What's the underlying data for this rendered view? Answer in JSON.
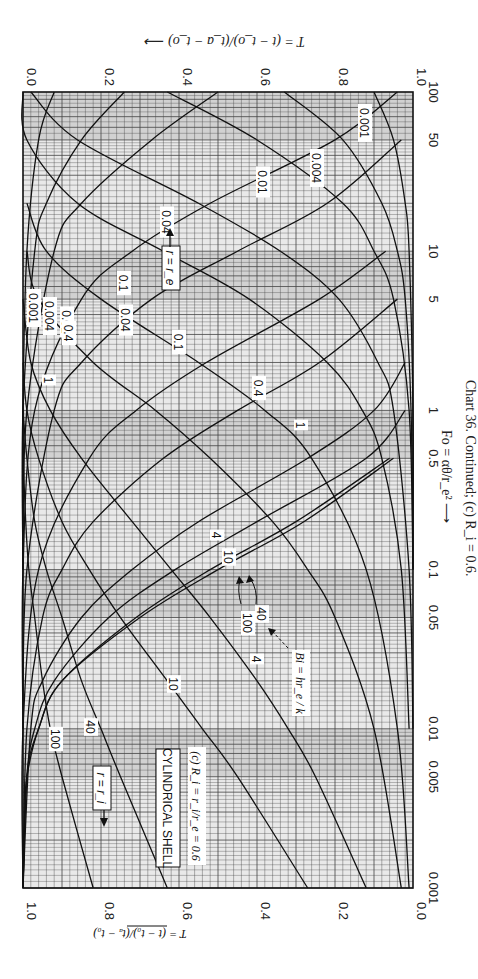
{
  "chart_data": {
    "type": "line",
    "title": "CYLINDRICAL SHELL",
    "subtitle": "(c) R_i = r_i/r_e = 0.6",
    "caption": "Chart 36. Continued; (c) R_i = 0.6.",
    "orientation": "rotated 90° clockwise (Fo axis vertical, T axis horizontal)",
    "xlabel": "Fo = αθ/r_e²",
    "xscale": "log",
    "xlim": [
      0.001,
      100
    ],
    "xticks": [
      0.001,
      0.005,
      0.01,
      0.05,
      0.1,
      0.5,
      1,
      5,
      10,
      50,
      100
    ],
    "xtick_labels": [
      "0.001",
      "0.005",
      "0.01",
      "0.05",
      "0.1",
      "0.5",
      "1",
      "5",
      "10",
      "50",
      "100"
    ],
    "ylabel": "T = (t − t_o)/(t_a − t_o)",
    "ylim": [
      0,
      1
    ],
    "yticks": [
      0.0,
      0.2,
      0.4,
      0.6,
      0.8,
      1.0
    ],
    "ytick_labels": [
      "0.0",
      "0.2",
      "0.4",
      "0.6",
      "0.8",
      "1.0"
    ],
    "grid": true,
    "parameter_label": "Bi = hr_e/k",
    "annotations": [
      "r = r_i",
      "r = r_e",
      "100",
      "40",
      "Bi = hr_e / k"
    ],
    "series_group_ri": {
      "name": "r = r_i",
      "axis": "left T-axis (1.0 at left, 0.0 at right)",
      "series": [
        {
          "name": "Bi=100",
          "x": [
            0.001,
            0.005,
            0.01,
            0.02,
            0.05,
            0.1,
            0.2,
            0.5,
            1
          ],
          "y": [
            0.82,
            0.9,
            0.93,
            0.95,
            0.97,
            0.985,
            0.993,
            0.999,
            1.0
          ]
        },
        {
          "name": "Bi=40",
          "x": [
            0.001,
            0.005,
            0.01,
            0.02,
            0.05,
            0.1,
            0.2,
            0.5,
            1
          ],
          "y": [
            0.63,
            0.75,
            0.8,
            0.85,
            0.9,
            0.94,
            0.97,
            0.99,
            1.0
          ]
        },
        {
          "name": "Bi=10",
          "x": [
            0.001,
            0.005,
            0.01,
            0.02,
            0.05,
            0.1,
            0.2,
            0.5,
            1,
            2
          ],
          "y": [
            0.27,
            0.45,
            0.54,
            0.63,
            0.75,
            0.83,
            0.9,
            0.96,
            0.99,
            1.0
          ]
        },
        {
          "name": "Bi=4",
          "x": [
            0.001,
            0.005,
            0.01,
            0.02,
            0.05,
            0.1,
            0.2,
            0.5,
            1,
            2,
            5
          ],
          "y": [
            0.12,
            0.25,
            0.32,
            0.4,
            0.52,
            0.62,
            0.72,
            0.85,
            0.93,
            0.98,
            1.0
          ]
        },
        {
          "name": "Bi=1",
          "x": [
            0.001,
            0.01,
            0.05,
            0.1,
            0.2,
            0.5,
            1,
            2,
            5,
            10
          ],
          "y": [
            0.03,
            0.1,
            0.2,
            0.27,
            0.36,
            0.52,
            0.66,
            0.82,
            0.96,
            0.99
          ]
        },
        {
          "name": "Bi=0.4",
          "x": [
            0.001,
            0.01,
            0.1,
            0.5,
            1,
            2,
            5,
            10,
            20
          ],
          "y": [
            0.01,
            0.04,
            0.12,
            0.26,
            0.38,
            0.55,
            0.8,
            0.94,
            0.99
          ]
        },
        {
          "name": "Bi=0.1",
          "x": [
            0.01,
            0.1,
            0.5,
            1,
            2,
            5,
            10,
            20,
            50,
            100
          ],
          "y": [
            0.01,
            0.03,
            0.08,
            0.13,
            0.22,
            0.42,
            0.64,
            0.86,
            0.99,
            1.0
          ]
        },
        {
          "name": "Bi=0.04",
          "x": [
            0.01,
            0.1,
            1,
            2,
            5,
            10,
            20,
            50,
            100
          ],
          "y": [
            0.0,
            0.01,
            0.05,
            0.09,
            0.19,
            0.34,
            0.55,
            0.86,
            0.98
          ]
        },
        {
          "name": "Bi=0.01",
          "x": [
            0.1,
            1,
            5,
            10,
            20,
            50,
            100
          ],
          "y": [
            0.0,
            0.01,
            0.05,
            0.1,
            0.18,
            0.4,
            0.63
          ]
        },
        {
          "name": "Bi=0.004",
          "x": [
            0.1,
            1,
            5,
            10,
            20,
            50,
            100
          ],
          "y": [
            0.0,
            0.005,
            0.02,
            0.04,
            0.08,
            0.18,
            0.33
          ]
        },
        {
          "name": "Bi=0.001",
          "x": [
            0.1,
            1,
            10,
            20,
            50,
            100
          ],
          "y": [
            0.0,
            0.0,
            0.01,
            0.02,
            0.05,
            0.1
          ]
        }
      ]
    },
    "series_group_re": {
      "name": "r = r_e",
      "axis": "right T-axis (0.0 at left, 1.0 at right)",
      "series": [
        {
          "name": "Bi=100",
          "x": [
            0.001,
            0.003,
            0.005,
            0.01,
            0.02,
            0.05,
            0.1,
            0.2,
            0.5
          ],
          "y": [
            0.0,
            0.005,
            0.01,
            0.04,
            0.1,
            0.3,
            0.5,
            0.72,
            0.95
          ]
        },
        {
          "name": "Bi=40",
          "x": [
            0.001,
            0.005,
            0.01,
            0.02,
            0.05,
            0.1,
            0.2,
            0.5
          ],
          "y": [
            0.0,
            0.01,
            0.04,
            0.1,
            0.29,
            0.48,
            0.7,
            0.94
          ]
        },
        {
          "name": "Bi=10",
          "x": [
            0.001,
            0.005,
            0.01,
            0.02,
            0.05,
            0.1,
            0.2,
            0.5,
            1
          ],
          "y": [
            0.0,
            0.01,
            0.03,
            0.08,
            0.22,
            0.39,
            0.6,
            0.88,
            0.98
          ]
        },
        {
          "name": "Bi=4",
          "x": [
            0.001,
            0.01,
            0.02,
            0.05,
            0.1,
            0.2,
            0.5,
            1,
            2
          ],
          "y": [
            0.0,
            0.02,
            0.05,
            0.15,
            0.28,
            0.45,
            0.73,
            0.9,
            0.98
          ]
        },
        {
          "name": "Bi=1",
          "x": [
            0.001,
            0.01,
            0.05,
            0.1,
            0.2,
            0.5,
            1,
            2,
            5
          ],
          "y": [
            0.0,
            0.01,
            0.05,
            0.1,
            0.18,
            0.36,
            0.55,
            0.76,
            0.96
          ]
        },
        {
          "name": "Bi=0.4",
          "x": [
            0.001,
            0.01,
            0.1,
            0.5,
            1,
            2,
            5,
            10
          ],
          "y": [
            0.0,
            0.0,
            0.04,
            0.17,
            0.29,
            0.47,
            0.76,
            0.93
          ]
        },
        {
          "name": "Bi=0.1",
          "x": [
            0.01,
            0.1,
            1,
            2,
            5,
            10,
            20,
            50
          ],
          "y": [
            0.0,
            0.01,
            0.08,
            0.15,
            0.33,
            0.55,
            0.78,
            0.97
          ]
        },
        {
          "name": "Bi=0.04",
          "x": [
            0.01,
            0.1,
            1,
            5,
            10,
            20,
            50,
            100
          ],
          "y": [
            0.0,
            0.0,
            0.03,
            0.15,
            0.28,
            0.48,
            0.8,
            0.96
          ]
        },
        {
          "name": "Bi=0.01",
          "x": [
            0.1,
            1,
            10,
            20,
            50,
            100
          ],
          "y": [
            0.0,
            0.01,
            0.08,
            0.15,
            0.33,
            0.5
          ]
        },
        {
          "name": "Bi=0.004",
          "x": [
            0.1,
            1,
            10,
            20,
            50,
            100
          ],
          "y": [
            0.0,
            0.0,
            0.03,
            0.06,
            0.15,
            0.26
          ]
        },
        {
          "name": "Bi=0.001",
          "x": [
            0.1,
            1,
            10,
            50,
            100
          ],
          "y": [
            0.0,
            0.0,
            0.01,
            0.04,
            0.08
          ]
        }
      ]
    }
  },
  "labels": {
    "top_axis_title": "T = (t − t_o)/(t_a − t_o) ⟶",
    "bottom_axis_title": "T = (t − t_o)/(t_a − t_o) ⟶",
    "fo_axis_title": "Fo = αθ/r_e² ⟶",
    "caption": "Chart 36.  Continued; (c)  R_i = 0.6.",
    "box_title": "CYLINDRICAL SHELL",
    "box_subtitle": "(c)  R_i = r_i/r_e = 0.6",
    "re_label": "r = r_e",
    "ri_label": "r = r_i",
    "bi_label": "Bi = hr_e / k"
  }
}
